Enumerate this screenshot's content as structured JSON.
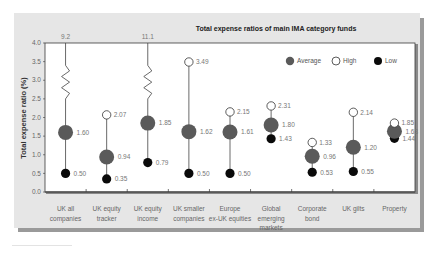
{
  "chart_data": {
    "type": "scatter",
    "subtype": "range-dot",
    "title": "Total expense ratios of main IMA category funds",
    "xlabel": "",
    "ylabel": "Total expense ratio (%)",
    "ylim": [
      0,
      4.0
    ],
    "yticks": [
      "0.0",
      "0.5",
      "1.0",
      "1.5",
      "2.0",
      "2.5",
      "3.0",
      "3.5",
      "4.0"
    ],
    "grid": false,
    "legend_position": "top-right",
    "legend": [
      {
        "name": "Average",
        "marker": "large-gray-circle"
      },
      {
        "name": "High",
        "marker": "open-circle"
      },
      {
        "name": "Low",
        "marker": "black-circle"
      }
    ],
    "categories": [
      [
        "UK all",
        "companies"
      ],
      [
        "UK equity",
        "tracker"
      ],
      [
        "UK equity",
        "income"
      ],
      [
        "UK smaller",
        "companies"
      ],
      [
        "Europe",
        "ex-UK equities"
      ],
      [
        "Global",
        "emerging",
        "markets"
      ],
      [
        "Corporate",
        "bond"
      ],
      [
        "UK gilts"
      ],
      [
        "Property"
      ]
    ],
    "series": [
      {
        "name": "Average",
        "values": [
          1.6,
          0.94,
          1.85,
          1.62,
          1.61,
          1.8,
          0.96,
          1.2,
          1.63
        ],
        "labels": [
          "1.60",
          "0.94",
          "1.85",
          "1.62",
          "1.61",
          "1.80",
          "0.96",
          "1.20",
          "1.63"
        ]
      },
      {
        "name": "High",
        "values": [
          9.2,
          2.07,
          11.1,
          3.49,
          2.15,
          2.31,
          1.33,
          2.14,
          1.85
        ],
        "labels": [
          "9.2",
          "2.07",
          "11.1",
          "3.49",
          "2.15",
          "2.31",
          "1.33",
          "2.14",
          "1.85"
        ]
      },
      {
        "name": "Low",
        "values": [
          0.5,
          0.35,
          0.79,
          0.5,
          0.5,
          1.43,
          0.53,
          0.55,
          1.44
        ],
        "labels": [
          "0.50",
          "0.35",
          "0.79",
          "0.50",
          "0.50",
          "1.43",
          "0.53",
          "0.55",
          "1.44"
        ]
      }
    ],
    "annotations": [
      "Axis break (zigzag) on UK all companies and UK equity income; high values 9.2 and 11.1 printed above the plot"
    ]
  },
  "colors": {
    "panel": "#e6e6e6",
    "panel_shadow": "#9a9a9a",
    "plot_bg": "#ffffff",
    "axis": "#3a3a3a",
    "average": "#5a5a5a",
    "high_fill": "#ffffff",
    "low": "#0a0a0a",
    "stem": "#444444"
  }
}
